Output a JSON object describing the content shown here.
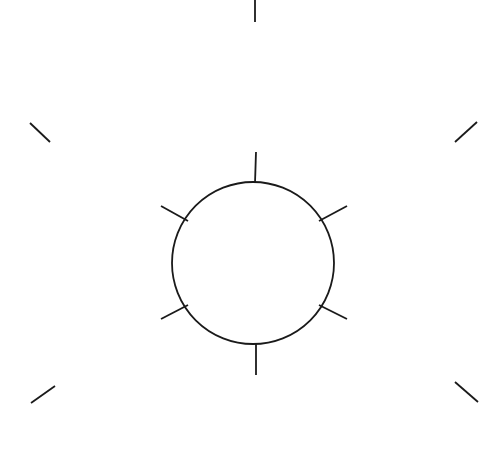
{
  "figure": {
    "type": "line-drawing",
    "background_color": "#ffffff",
    "stroke_color": "#1a1a1a",
    "canvas": {
      "width": 503,
      "height": 461
    },
    "circle": {
      "name": "central-circle",
      "center_x": 253,
      "center_y": 263,
      "radius": 81,
      "stroke_width": 1.8
    },
    "inner_rays": [
      {
        "name": "ray-top",
        "angle_deg": 90,
        "x1": 255,
        "y1": 183,
        "x2": 256,
        "y2": 152,
        "stroke_width": 1.8
      },
      {
        "name": "ray-upper-left",
        "angle_deg": 150,
        "x1": 188,
        "y1": 221,
        "x2": 161,
        "y2": 206,
        "stroke_width": 1.8
      },
      {
        "name": "ray-upper-right",
        "angle_deg": 30,
        "x1": 319,
        "y1": 221,
        "x2": 347,
        "y2": 206,
        "stroke_width": 1.8
      },
      {
        "name": "ray-lower-left",
        "angle_deg": 210,
        "x1": 188,
        "y1": 305,
        "x2": 161,
        "y2": 319,
        "stroke_width": 1.8
      },
      {
        "name": "ray-lower-right",
        "angle_deg": 330,
        "x1": 319,
        "y1": 305,
        "x2": 347,
        "y2": 319,
        "stroke_width": 1.8
      },
      {
        "name": "ray-bottom",
        "angle_deg": 270,
        "x1": 256,
        "y1": 343,
        "x2": 256,
        "y2": 375,
        "stroke_width": 1.8
      }
    ],
    "outer_fragments": [
      {
        "name": "fragment-top-center",
        "x1": 255,
        "y1": 0,
        "x2": 255,
        "y2": 22,
        "stroke_width": 1.8
      },
      {
        "name": "fragment-top-left",
        "x1": 30,
        "y1": 123,
        "x2": 50,
        "y2": 142,
        "stroke_width": 1.8
      },
      {
        "name": "fragment-top-right",
        "x1": 455,
        "y1": 142,
        "x2": 477,
        "y2": 122,
        "stroke_width": 1.8
      },
      {
        "name": "fragment-bottom-left",
        "x1": 31,
        "y1": 403,
        "x2": 55,
        "y2": 386,
        "stroke_width": 1.8
      },
      {
        "name": "fragment-bottom-right",
        "x1": 455,
        "y1": 382,
        "x2": 478,
        "y2": 402,
        "stroke_width": 1.8
      }
    ]
  }
}
